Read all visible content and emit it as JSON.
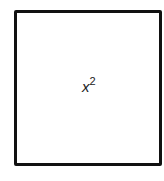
{
  "diagram": {
    "shape": "square",
    "label": {
      "base": "x",
      "exponent": "2"
    },
    "stroke_color": "#111111",
    "fill_color": "#ffffff"
  }
}
